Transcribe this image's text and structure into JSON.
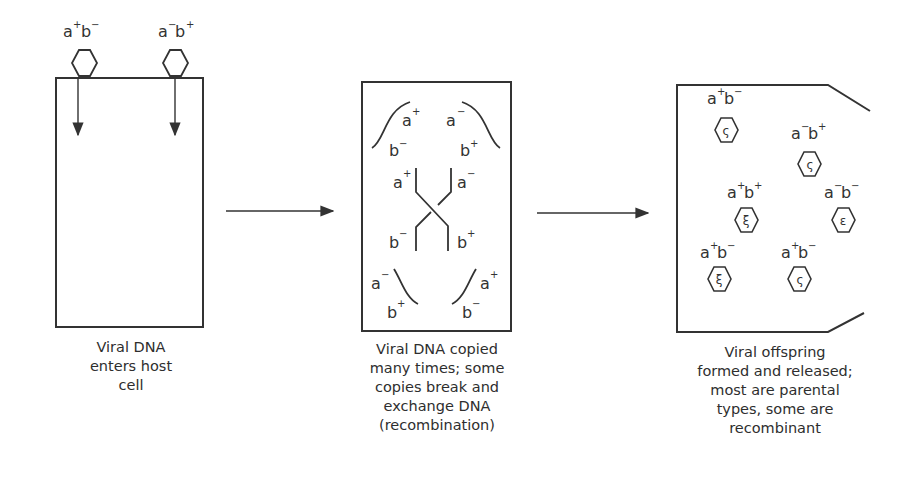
{
  "panels": [
    {
      "id": "entry",
      "caption": [
        "Viral DNA",
        "enters host",
        "cell"
      ],
      "phages": [
        {
          "a": "a",
          "a_sign": "+",
          "b": "b",
          "b_sign": "−"
        },
        {
          "a": "a",
          "a_sign": "−",
          "b": "b",
          "b_sign": "+"
        }
      ]
    },
    {
      "id": "replication",
      "caption": [
        "Viral DNA copied",
        "many times; some",
        "copies break and",
        "exchange DNA",
        "(recombination)"
      ],
      "labels": {
        "top_left_a": {
          "base": "a",
          "sign": "+"
        },
        "top_left_b": {
          "base": "b",
          "sign": "−"
        },
        "top_right_a": {
          "base": "a",
          "sign": "−"
        },
        "top_right_b": {
          "base": "b",
          "sign": "+"
        },
        "cross_left_a": {
          "base": "a",
          "sign": "+"
        },
        "cross_right_a": {
          "base": "a",
          "sign": "−"
        },
        "cross_left_b": {
          "base": "b",
          "sign": "−"
        },
        "cross_right_b": {
          "base": "b",
          "sign": "+"
        },
        "bottom_left_a": {
          "base": "a",
          "sign": "−"
        },
        "bottom_left_b": {
          "base": "b",
          "sign": "+"
        },
        "bottom_right_a": {
          "base": "a",
          "sign": "+"
        },
        "bottom_right_b": {
          "base": "b",
          "sign": "−"
        }
      }
    },
    {
      "id": "release",
      "caption": [
        "Viral offspring",
        "formed and released;",
        "most are parental",
        "types, some are",
        "recombinant"
      ],
      "offspring": [
        {
          "a_sign": "+",
          "b_sign": "−"
        },
        {
          "a_sign": "−",
          "b_sign": "+"
        },
        {
          "a_sign": "+",
          "b_sign": "+"
        },
        {
          "a_sign": "−",
          "b_sign": "−"
        },
        {
          "a_sign": "+",
          "b_sign": "−"
        },
        {
          "a_sign": "+",
          "b_sign": "−"
        }
      ]
    }
  ],
  "arrows": [
    "entry-to-replication",
    "replication-to-release"
  ],
  "colors": {
    "stroke": "#333333",
    "background": "#ffffff"
  }
}
